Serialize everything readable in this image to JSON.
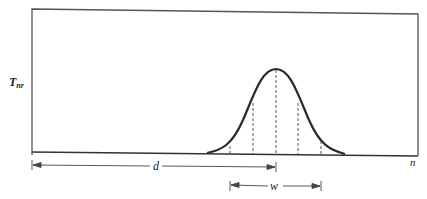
{
  "diagram": {
    "y_axis_label": "T",
    "y_axis_label_subscript": "nr",
    "x_axis_label": "n",
    "distance_label": "d",
    "width_label": "w"
  },
  "colors": {
    "line": "#2a2a2a",
    "frame": "#555555",
    "dashed": "#444444",
    "background": "#ffffff"
  }
}
